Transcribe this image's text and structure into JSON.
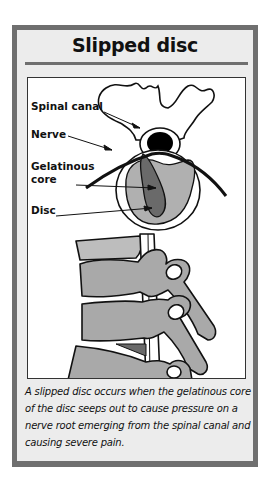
{
  "figure": {
    "title": "Slipped disc",
    "labels": {
      "spinal_canal": "Spinal canal",
      "nerve": "Nerve",
      "gelatinous_core_line1": "Gelatinous",
      "gelatinous_core_line2": "core",
      "disc": "Disc"
    },
    "caption": "A slipped disc occurs when the gelatinous core of the disc seeps out to cause pressure on a nerve root emerging from the spinal canal and causing severe pain.",
    "colors": {
      "frame": "#6f6f6f",
      "panel": "#ececec",
      "bone": "#a9a9a9",
      "disc": "#b0b0b0",
      "core": "#6a6a6a",
      "canal": "#000000"
    }
  }
}
